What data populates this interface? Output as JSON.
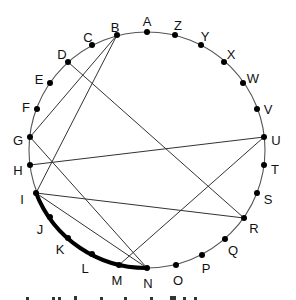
{
  "diagram": {
    "circle": {
      "cx": 147,
      "cy": 150,
      "r": 118,
      "stroke": "#555555"
    },
    "points": [
      {
        "id": "A",
        "x": 147,
        "y": 32,
        "lx": 147,
        "ly": 22
      },
      {
        "id": "Z",
        "x": 175,
        "y": 35,
        "lx": 178,
        "ly": 26
      },
      {
        "id": "Y",
        "x": 201,
        "y": 45,
        "lx": 205,
        "ly": 37
      },
      {
        "id": "X",
        "x": 224,
        "y": 62,
        "lx": 231,
        "ly": 55
      },
      {
        "id": "W",
        "x": 243,
        "y": 83,
        "lx": 253,
        "ly": 79
      },
      {
        "id": "V",
        "x": 257,
        "y": 109,
        "lx": 268,
        "ly": 110
      },
      {
        "id": "U",
        "x": 264,
        "y": 137,
        "lx": 276,
        "ly": 141
      },
      {
        "id": "T",
        "x": 264,
        "y": 165,
        "lx": 275,
        "ly": 170
      },
      {
        "id": "S",
        "x": 257,
        "y": 193,
        "lx": 268,
        "ly": 200
      },
      {
        "id": "R",
        "x": 244,
        "y": 218,
        "lx": 254,
        "ly": 229
      },
      {
        "id": "Q",
        "x": 225,
        "y": 239,
        "lx": 233,
        "ly": 251
      },
      {
        "id": "P",
        "x": 202,
        "y": 255,
        "lx": 206,
        "ly": 269
      },
      {
        "id": "O",
        "x": 176,
        "y": 265,
        "lx": 178,
        "ly": 281
      },
      {
        "id": "N",
        "x": 147,
        "y": 268,
        "lx": 148,
        "ly": 284
      },
      {
        "id": "M",
        "x": 119,
        "y": 265,
        "lx": 117,
        "ly": 281
      },
      {
        "id": "L",
        "x": 92,
        "y": 254,
        "lx": 85,
        "ly": 269
      },
      {
        "id": "K",
        "x": 68,
        "y": 238,
        "lx": 60,
        "ly": 250
      },
      {
        "id": "J",
        "x": 50,
        "y": 217,
        "lx": 40,
        "ly": 230
      },
      {
        "id": "I",
        "x": 36,
        "y": 193,
        "lx": 22,
        "ly": 200
      },
      {
        "id": "H",
        "x": 30,
        "y": 165,
        "lx": 18,
        "ly": 171
      },
      {
        "id": "G",
        "x": 30,
        "y": 137,
        "lx": 18,
        "ly": 141
      },
      {
        "id": "F",
        "x": 37,
        "y": 109,
        "lx": 26,
        "ly": 108
      },
      {
        "id": "E",
        "x": 50,
        "y": 83,
        "lx": 39,
        "ly": 80
      },
      {
        "id": "D",
        "x": 68,
        "y": 62,
        "lx": 62,
        "ly": 55
      },
      {
        "id": "C",
        "x": 92,
        "y": 45,
        "lx": 88,
        "ly": 38
      },
      {
        "id": "B",
        "x": 117,
        "y": 35,
        "lx": 115,
        "ly": 28
      }
    ],
    "chords": [
      {
        "from": "B",
        "to": "G"
      },
      {
        "from": "B",
        "to": "I"
      },
      {
        "from": "D",
        "to": "R"
      },
      {
        "from": "G",
        "to": "N"
      },
      {
        "from": "H",
        "to": "U"
      },
      {
        "from": "I",
        "to": "R"
      },
      {
        "from": "I",
        "to": "N"
      },
      {
        "from": "M",
        "to": "U"
      }
    ],
    "highlighted_arc": {
      "from": "I",
      "to": "N",
      "via": [
        "J",
        "K",
        "L",
        "M"
      ],
      "stroke_width": 4
    },
    "bottom_caption_partial": "(text cut off at bottom edge)"
  }
}
